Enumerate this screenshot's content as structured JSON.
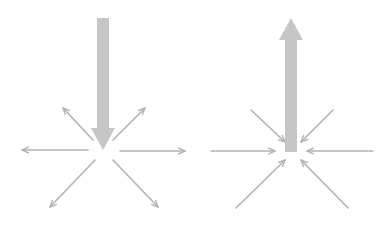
{
  "colors": {
    "background": "#ffffff",
    "big_arrow": "#c6c6c6",
    "small_arrow": "#b3b3b3"
  },
  "diagrams": [
    {
      "name": "left-divergent",
      "description": "Large downward arrow with six small arrows radiating outward from the tip",
      "big_arrow": {
        "direction": "down",
        "from": [
          103,
          18
        ],
        "to": [
          103,
          150
        ]
      },
      "small_arrows": [
        {
          "direction": "left",
          "from": [
            88,
            150
          ],
          "to": [
            22,
            150
          ]
        },
        {
          "direction": "right",
          "from": [
            120,
            151
          ],
          "to": [
            185,
            151
          ]
        },
        {
          "direction": "up-left",
          "from": [
            93,
            140
          ],
          "to": [
            63,
            108
          ]
        },
        {
          "direction": "up-right",
          "from": [
            113,
            140
          ],
          "to": [
            145,
            108
          ]
        },
        {
          "direction": "down-left",
          "from": [
            95,
            160
          ],
          "to": [
            50,
            207
          ]
        },
        {
          "direction": "down-right",
          "from": [
            113,
            160
          ],
          "to": [
            158,
            207
          ]
        }
      ]
    },
    {
      "name": "right-convergent",
      "description": "Large upward arrow with six small arrows converging inward at its base",
      "big_arrow": {
        "direction": "up",
        "from": [
          291,
          152
        ],
        "to": [
          291,
          18
        ]
      },
      "small_arrows": [
        {
          "direction": "right",
          "from": [
            211,
            151
          ],
          "to": [
            275,
            151
          ]
        },
        {
          "direction": "left",
          "from": [
            373,
            151
          ],
          "to": [
            307,
            151
          ]
        },
        {
          "direction": "down-right",
          "from": [
            251,
            110
          ],
          "to": [
            285,
            142
          ]
        },
        {
          "direction": "down-left",
          "from": [
            333,
            110
          ],
          "to": [
            301,
            142
          ]
        },
        {
          "direction": "up-right",
          "from": [
            236,
            208
          ],
          "to": [
            285,
            160
          ]
        },
        {
          "direction": "up-left",
          "from": [
            348,
            208
          ],
          "to": [
            301,
            160
          ]
        }
      ]
    }
  ]
}
